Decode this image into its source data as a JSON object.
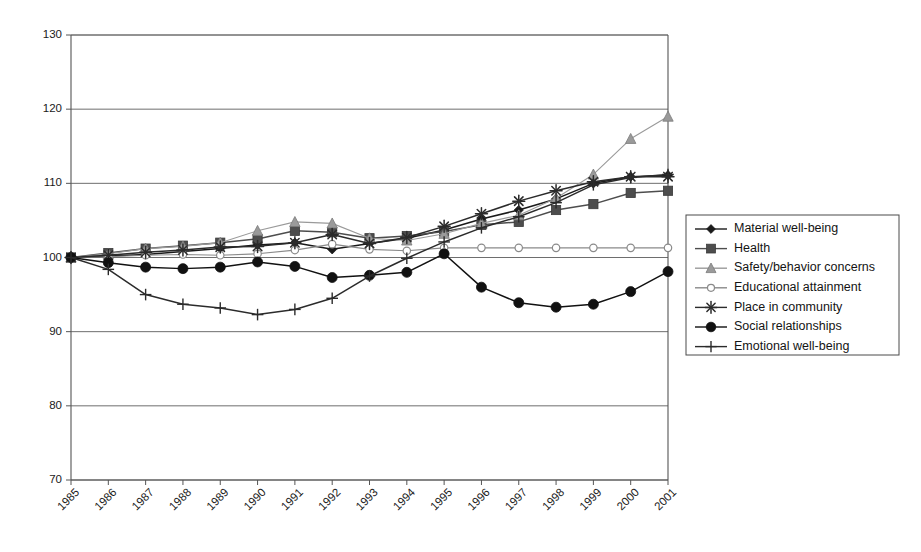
{
  "chart_data": {
    "type": "line",
    "title": "",
    "subtitle": "",
    "xlabel": "",
    "ylabel": "",
    "xlim": [
      1985,
      2001
    ],
    "ylim": [
      70,
      130
    ],
    "ytick_step": 10,
    "grid": true,
    "gridlines_y": [
      70,
      80,
      90,
      100,
      110,
      120,
      130
    ],
    "legend_position": "right",
    "x": [
      1985,
      1986,
      1987,
      1988,
      1989,
      1990,
      1991,
      1992,
      1993,
      1994,
      1995,
      1996,
      1997,
      1998,
      1999,
      2000,
      2001
    ],
    "xticklabels": [
      "1985",
      "1986",
      "1987",
      "1988",
      "1989",
      "1990",
      "1991",
      "1992",
      "1993",
      "1994",
      "1995",
      "1996",
      "1997",
      "1998",
      "1999",
      "2000",
      "2001"
    ],
    "yticklabels": [
      "70",
      "80",
      "90",
      "100",
      "110",
      "120",
      "130"
    ],
    "series": [
      {
        "name": "Material well-being",
        "marker": "filled-diamond",
        "color": "#1a1a1a",
        "values": [
          100.0,
          100.2,
          100.4,
          100.8,
          101.2,
          101.7,
          102.0,
          101.1,
          101.9,
          102.6,
          103.7,
          105.2,
          106.4,
          107.9,
          110.0,
          110.9,
          111.1
        ]
      },
      {
        "name": "Health",
        "marker": "filled-square",
        "color": "#4d4d4d",
        "values": [
          100.0,
          100.6,
          101.2,
          101.6,
          102.0,
          102.5,
          103.6,
          103.4,
          102.6,
          102.9,
          103.5,
          104.4,
          104.8,
          106.4,
          107.2,
          108.7,
          109.0
        ]
      },
      {
        "name": "Safety/behavior concerns",
        "marker": "filled-triangle",
        "color": "#9a9a9a",
        "values": [
          100.0,
          100.5,
          101.2,
          101.5,
          102.0,
          103.6,
          104.8,
          104.6,
          102.6,
          102.3,
          103.2,
          104.6,
          105.7,
          108.0,
          111.2,
          116.0,
          119.0
        ]
      },
      {
        "name": "Educational attainment",
        "marker": "open-circle",
        "color": "#8a8a8a",
        "values": [
          100.0,
          100.1,
          100.3,
          100.4,
          100.3,
          100.5,
          101.0,
          101.8,
          101.1,
          100.9,
          101.3,
          101.3,
          101.3,
          101.3,
          101.3,
          101.3,
          101.3
        ]
      },
      {
        "name": "Place in community",
        "marker": "asterisk",
        "color": "#2b2b2b",
        "values": [
          100.0,
          100.3,
          100.7,
          101.0,
          101.4,
          101.5,
          102.0,
          103.1,
          101.9,
          102.7,
          104.2,
          105.9,
          107.6,
          109.0,
          110.2,
          110.9,
          110.9
        ]
      },
      {
        "name": "Social relationships",
        "marker": "filled-circle",
        "color": "#111111",
        "values": [
          100.0,
          99.3,
          98.7,
          98.5,
          98.7,
          99.4,
          98.8,
          97.3,
          97.6,
          98.0,
          100.5,
          96.0,
          93.9,
          93.3,
          93.7,
          95.4,
          98.1
        ]
      },
      {
        "name": "Emotional well-being",
        "marker": "plus",
        "color": "#2b2b2b",
        "values": [
          100.0,
          98.4,
          95.0,
          93.7,
          93.2,
          92.3,
          93.0,
          94.5,
          97.5,
          99.9,
          102.1,
          104.0,
          105.5,
          107.4,
          109.8,
          110.8,
          111.2
        ]
      }
    ]
  },
  "legend": {
    "items": [
      {
        "label": "Material well-being"
      },
      {
        "label": "Health"
      },
      {
        "label": "Safety/behavior concerns"
      },
      {
        "label": "Educational attainment"
      },
      {
        "label": "Place in community"
      },
      {
        "label": "Social relationships"
      },
      {
        "label": "Emotional well-being"
      }
    ]
  }
}
